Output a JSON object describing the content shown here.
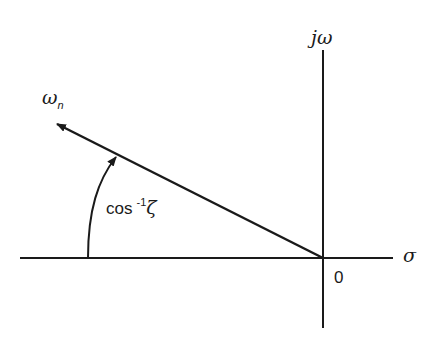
{
  "diagram": {
    "axes": {
      "vertical_label": "jω",
      "horizontal_label": "σ",
      "origin_label": "0"
    },
    "vector": {
      "label_main": "ω",
      "label_sub": "n"
    },
    "angle": {
      "label_prefix": "cos",
      "label_sup": "-1",
      "label_symbol": "ζ"
    },
    "colors": {
      "stroke": "#1a1a1a",
      "background": "#ffffff"
    }
  }
}
